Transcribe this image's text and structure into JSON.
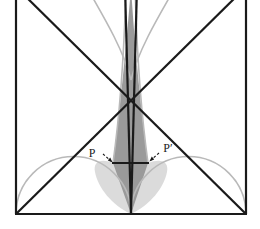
{
  "figure": {
    "type": "geometry-diagram",
    "title": "",
    "background_color": "#ffffff",
    "canvas": {
      "width": 260,
      "height": 229
    }
  },
  "colors": {
    "stroke_dark": "#1a1a1a",
    "stroke_light_arc": "#b9b9b9",
    "shade_fill": "#9a9a9a",
    "shade_fill_light": "#c9c9c9",
    "label_color": "#1a1a1a",
    "background": "#ffffff"
  },
  "square": {
    "name": "bounding-square",
    "left": 16,
    "right": 246,
    "bottom": 214,
    "top": -14,
    "stroke_width": 2.2
  },
  "points": {
    "bottom_left": {
      "x": 16,
      "y": 214
    },
    "bottom_right": {
      "x": 246,
      "y": 214
    },
    "bottom_center": {
      "x": 131,
      "y": 214
    },
    "apex_top": {
      "x": 131,
      "y": -14
    },
    "P": {
      "x": 113,
      "y": 163
    },
    "P_prime": {
      "x": 148,
      "y": 163
    }
  },
  "arcs": [
    {
      "name": "left-semicircle",
      "center_x": 73.5,
      "center_y": 214,
      "radius": 57.5,
      "stroke": "#b9b9b9"
    },
    {
      "name": "right-semicircle",
      "center_x": 188.5,
      "center_y": 214,
      "radius": 57.5,
      "stroke": "#b9b9b9"
    }
  ],
  "lines": [
    {
      "name": "diagonal-bottomleft-to-topright",
      "x1": 16,
      "y1": 214,
      "x2": 247,
      "y2": -14
    },
    {
      "name": "diagonal-bottomright-to-topleft",
      "x1": 246,
      "y1": 214,
      "x2": 15,
      "y2": -14
    },
    {
      "name": "spindle-left-edge",
      "x1": 131,
      "y1": 214,
      "x2": 126,
      "y2": -14
    },
    {
      "name": "spindle-right-edge",
      "x1": 131,
      "y1": 214,
      "x2": 136,
      "y2": -14
    },
    {
      "name": "chord-P-to-P-prime",
      "x1": 113,
      "y1": 163,
      "x2": 148,
      "y2": 163
    }
  ],
  "labels": [
    {
      "id": "P",
      "name": "point-label-P",
      "text": "P",
      "x": 92,
      "y": 157,
      "leader": {
        "x1": 102,
        "y1": 154,
        "x2": 110,
        "y2": 161
      }
    },
    {
      "id": "P_prime",
      "name": "point-label-P-prime",
      "text": "P′",
      "x": 162,
      "y": 153,
      "leader": {
        "x1": 160,
        "y1": 152,
        "x2": 151,
        "y2": 160
      }
    }
  ],
  "shaded_region": {
    "name": "central-spindle-shade",
    "description": "vertical lens/spindle shaped shaded region between the two arcs, widest near the chord PP'",
    "fill": "#9a9a9a"
  }
}
